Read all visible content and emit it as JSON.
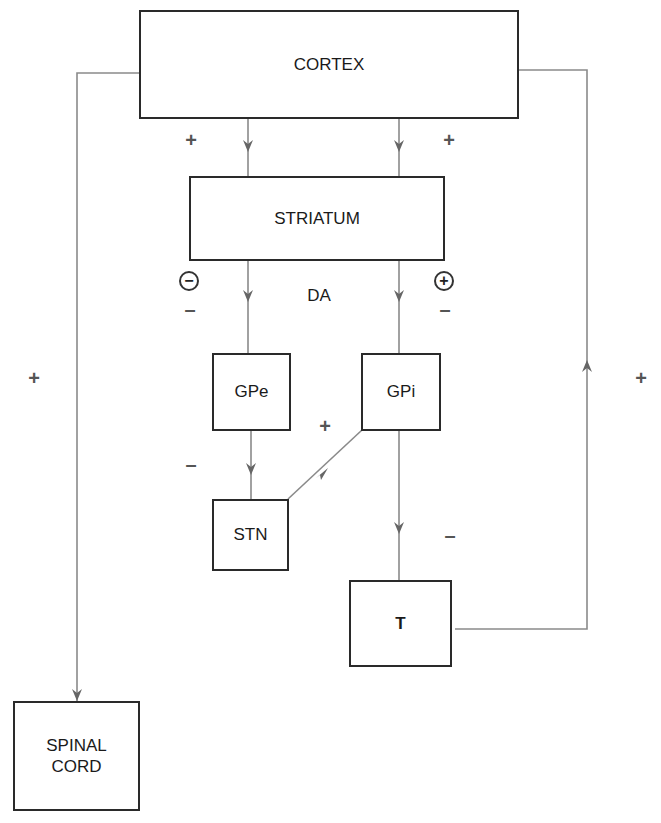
{
  "diagram": {
    "type": "flowchart",
    "nodes": {
      "cortex": "CORTEX",
      "striatum": "STRIATUM",
      "gpe": "GPe",
      "gpi": "GPi",
      "stn": "STN",
      "thalamus": "T",
      "spinal_cord_line1": "SPINAL",
      "spinal_cord_line2": "CORD"
    },
    "labels": {
      "da": "DA",
      "cortex_striatum_left": "+",
      "cortex_striatum_right": "+",
      "striatum_gpe_receptor": "−",
      "striatum_gpe_effect": "–",
      "striatum_gpi_receptor": "+",
      "striatum_gpi_effect": "–",
      "gpe_stn": "–",
      "stn_gpi": "+",
      "gpi_t": "–",
      "cortex_spinal": "+",
      "t_cortex": "+"
    },
    "edges": [
      {
        "from": "CORTEX",
        "to": "STRIATUM",
        "sign": "+"
      },
      {
        "from": "CORTEX",
        "to": "STRIATUM",
        "sign": "+"
      },
      {
        "from": "STRIATUM",
        "to": "GPe",
        "sign": "–",
        "receptor": "−"
      },
      {
        "from": "STRIATUM",
        "to": "GPi",
        "sign": "–",
        "receptor": "+"
      },
      {
        "from": "GPe",
        "to": "STN",
        "sign": "–"
      },
      {
        "from": "STN",
        "to": "GPi",
        "sign": "+"
      },
      {
        "from": "GPi",
        "to": "T",
        "sign": "–"
      },
      {
        "from": "T",
        "to": "CORTEX",
        "sign": "+"
      },
      {
        "from": "CORTEX",
        "to": "SPINAL CORD",
        "sign": "+"
      }
    ]
  }
}
